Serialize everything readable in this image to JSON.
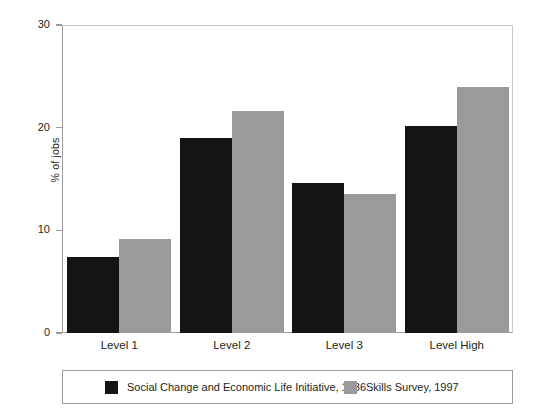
{
  "chart_data": {
    "type": "bar",
    "title": "",
    "subtitle": "",
    "xlabel": "",
    "ylabel": "% of jobs",
    "categories": [
      "Level 1",
      "Level 2",
      "Level 3",
      "Level High"
    ],
    "series": [
      {
        "name": "Social Change and Economic Life Initiative, 1986",
        "color": "#141414",
        "values": [
          7.4,
          19.0,
          14.6,
          20.2
        ]
      },
      {
        "name": "Skills Survey, 1997",
        "color": "#9a9a9a",
        "values": [
          9.2,
          21.6,
          13.5,
          24.0
        ]
      }
    ],
    "ylim": [
      0,
      30
    ],
    "yticks": [
      0,
      10,
      20,
      30
    ],
    "ytick_labels": [
      "0",
      "10",
      "20",
      "30"
    ],
    "grid": false,
    "legend_position": "bottom"
  },
  "axes": {
    "y_title": "% of jobs",
    "y_ticks": [
      {
        "value": 30,
        "label": "30"
      },
      {
        "value": 20,
        "label": "20"
      },
      {
        "value": 10,
        "label": "10"
      },
      {
        "value": 0,
        "label": "0"
      }
    ],
    "x_categories": [
      "Level 1",
      "Level 2",
      "Level 3",
      "Level High"
    ]
  },
  "legend": {
    "entries": [
      {
        "label": "Social Change and Economic Life Initiative, 1986",
        "color": "#141414"
      },
      {
        "label": "Skills Survey, 1997",
        "color": "#9a9a9a"
      }
    ]
  }
}
